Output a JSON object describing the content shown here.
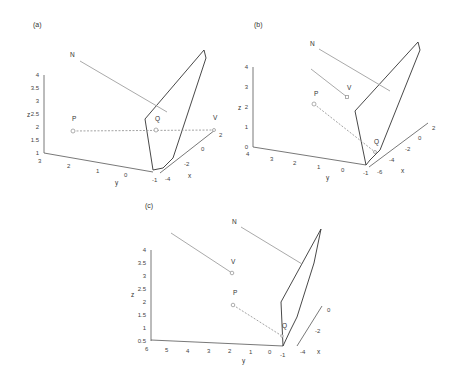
{
  "figure": {
    "panels": [
      {
        "label": "(a)",
        "points": {
          "N": "N",
          "P": "P",
          "Q": "Q",
          "V": "V"
        },
        "axes": {
          "z": {
            "label": "z",
            "ticks": [
              "1",
              "1.5",
              "2",
              "2.5",
              "3",
              "3.5",
              "4"
            ]
          },
          "y": {
            "label": "y",
            "ticks": [
              "3",
              "2",
              "1",
              "0",
              "-1"
            ]
          },
          "x": {
            "label": "x",
            "ticks": [
              "-4",
              "-2",
              "0",
              "2"
            ]
          }
        }
      },
      {
        "label": "(b)",
        "points": {
          "N": "N",
          "P": "P",
          "Q": "Q",
          "V": "V"
        },
        "axes": {
          "z": {
            "label": "z",
            "ticks": [
              "0",
              "1",
              "2",
              "3",
              "4"
            ]
          },
          "y": {
            "label": "y",
            "ticks": [
              "4",
              "3",
              "2",
              "1",
              "0",
              "-1"
            ]
          },
          "x": {
            "label": "x",
            "ticks": [
              "-6",
              "-4",
              "-2",
              "0",
              "2"
            ]
          }
        }
      },
      {
        "label": "(c)",
        "points": {
          "N": "N",
          "P": "P",
          "Q": "Q",
          "V": "V"
        },
        "axes": {
          "z": {
            "label": "z",
            "ticks": [
              "0.5",
              "1",
              "1.5",
              "2",
              "2.5",
              "3",
              "3.5",
              "4"
            ]
          },
          "y": {
            "label": "y",
            "ticks": [
              "6",
              "5",
              "4",
              "3",
              "2",
              "1",
              "0",
              "-1"
            ]
          },
          "x": {
            "label": "x",
            "ticks": [
              "-4",
              "-2",
              "0"
            ]
          }
        }
      }
    ]
  }
}
